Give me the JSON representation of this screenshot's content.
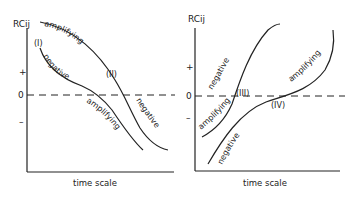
{
  "left_panel": {
    "y_axis_label": "RCij",
    "plus": "+",
    "zero": "0",
    "minus": "–",
    "x_axis_label": "time scale",
    "curve_I_label": "(I)",
    "curve_II_label": "(II)",
    "curve_I_top": "negative",
    "curve_I_bottom": "amplifying",
    "curve_II_top": "amplifying",
    "curve_II_bottom": "negative"
  },
  "right_panel": {
    "y_axis_label": "RCij",
    "plus": "+",
    "zero": "0",
    "minus": "–",
    "x_axis_label": "time scale",
    "curve_III_label": "(III)",
    "curve_IV_label": "(IV)",
    "curve_III_top": "negative",
    "curve_III_bottom": "amplifying",
    "curve_IV_top": "amplifying",
    "curve_IV_bottom": "negative"
  },
  "colors": {
    "line": "#222222",
    "background": "#ffffff"
  }
}
